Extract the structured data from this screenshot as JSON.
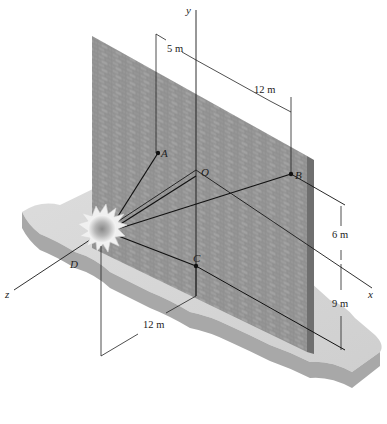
{
  "figure": {
    "axes": {
      "x": "x",
      "y": "y",
      "z": "z"
    },
    "points": {
      "A": "A",
      "O": "O",
      "B": "B",
      "C": "C",
      "D": "D"
    },
    "dimensions": {
      "top_left": "5 m",
      "top_right": "12 m",
      "right_upper": "6 m",
      "right_lower": "9 m",
      "bottom": "12 m"
    },
    "colors": {
      "wall": "#8e8e8e",
      "wall_edge": "#6f6f6f",
      "ground_top": "#d9d9d9",
      "ground_side": "#a8a8a8",
      "lines": "#1a1a1a",
      "explosion_core": "#8a8a8a"
    }
  }
}
